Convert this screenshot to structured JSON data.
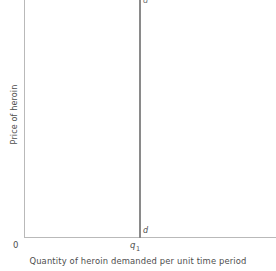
{
  "chart_data": {
    "type": "line",
    "title": "",
    "subtitle": "",
    "xlabel": "Quantity of heroin demanded per unit time period",
    "ylabel": "Price of heroin",
    "grid": false,
    "legend": "none",
    "origin_label": "0",
    "xlim": [
      0,
      1
    ],
    "ylim": [
      0,
      1
    ],
    "x_ticks": [
      {
        "label": "q",
        "subscript": "1",
        "value": 0.46
      }
    ],
    "y_ticks": [],
    "series": [
      {
        "name": "d",
        "description": "Perfectly inelastic demand curve for heroin",
        "curve_type": "vertical",
        "x": [
          0.46,
          0.46
        ],
        "y": [
          0.0,
          1.0
        ],
        "annotations": [
          {
            "text": "d",
            "position": "top-of-line"
          },
          {
            "text": "d",
            "position": "bottom-of-line"
          }
        ]
      }
    ],
    "colors": {
      "background": "#ffffff",
      "axis": "#b9b9b9",
      "curve": "#8a8a8a",
      "text": "#4d4d4d"
    }
  },
  "figure": {
    "y_axis_title": "Price of heroin",
    "x_axis_title": "Quantity of heroin demanded per unit time period",
    "origin": "0",
    "q1_base": "q",
    "q1_sub": "1",
    "curve_label_top": "d",
    "curve_label_bottom": "d"
  }
}
